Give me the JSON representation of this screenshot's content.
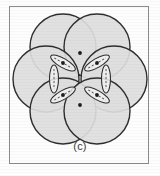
{
  "figure": {
    "caption": "(c)",
    "frame": {
      "border_color": "#8b8b8b",
      "background_color": "#fdfdfd",
      "x": 9,
      "y": 6,
      "width": 140,
      "height": 158
    },
    "page_background": "#ffffff"
  },
  "chart_data": {
    "type": "scatter",
    "title": "",
    "subtitle": "",
    "xlabel": "",
    "ylabel": "",
    "annotations": [
      "(c)"
    ],
    "grid": false,
    "legend": null,
    "xlim": [
      0,
      160
    ],
    "ylim": [
      0,
      176
    ],
    "circle_radius": 33,
    "circle_fill": "#dedede",
    "circle_stroke": "#2e2e2e",
    "circle_stroke_width": 1.4,
    "circle_count": 6,
    "circles": [
      {
        "id": "top-left",
        "cx": 63,
        "cy": 47,
        "r": 33
      },
      {
        "id": "top-right",
        "cx": 97,
        "cy": 47,
        "r": 33
      },
      {
        "id": "middle-left",
        "cx": 46,
        "cy": 79,
        "r": 33
      },
      {
        "id": "middle-right",
        "cx": 114,
        "cy": 79,
        "r": 33
      },
      {
        "id": "bottom-left",
        "cx": 63,
        "cy": 111,
        "r": 33
      },
      {
        "id": "bottom-right",
        "cx": 97,
        "cy": 111,
        "r": 33
      }
    ],
    "lens_count": 6,
    "lens_stroke": "#2e2e2e",
    "lens_dash_stroke": "#4a4a4a",
    "lenses": [
      {
        "id": "lens-left-vertical",
        "cx": 54,
        "cy": 79,
        "angle": 90,
        "rx": 4.5,
        "ry": 14
      },
      {
        "id": "lens-right-vertical",
        "cx": 106,
        "cy": 79,
        "angle": 90,
        "rx": 4.5,
        "ry": 14
      },
      {
        "id": "lens-top-left-diag",
        "cx": 63,
        "cy": 63,
        "angle": 30,
        "rx": 4.5,
        "ry": 14
      },
      {
        "id": "lens-top-right-diag",
        "cx": 97,
        "cy": 63,
        "angle": -30,
        "rx": 4.5,
        "ry": 14
      },
      {
        "id": "lens-bot-left-diag",
        "cx": 63,
        "cy": 95,
        "angle": -30,
        "rx": 4.5,
        "ry": 14
      },
      {
        "id": "lens-bot-right-diag",
        "cx": 97,
        "cy": 95,
        "angle": 30,
        "rx": 4.5,
        "ry": 14
      }
    ],
    "nodes": [
      {
        "id": "node-upper-left",
        "cx": 63,
        "cy": 63
      },
      {
        "id": "node-upper-right",
        "cx": 97,
        "cy": 63
      },
      {
        "id": "node-lower-left",
        "cx": 63,
        "cy": 95
      },
      {
        "id": "node-lower-right",
        "cx": 97,
        "cy": 95
      },
      {
        "id": "node-top",
        "cx": 80,
        "cy": 53
      },
      {
        "id": "node-bottom",
        "cx": 80,
        "cy": 105
      }
    ]
  }
}
